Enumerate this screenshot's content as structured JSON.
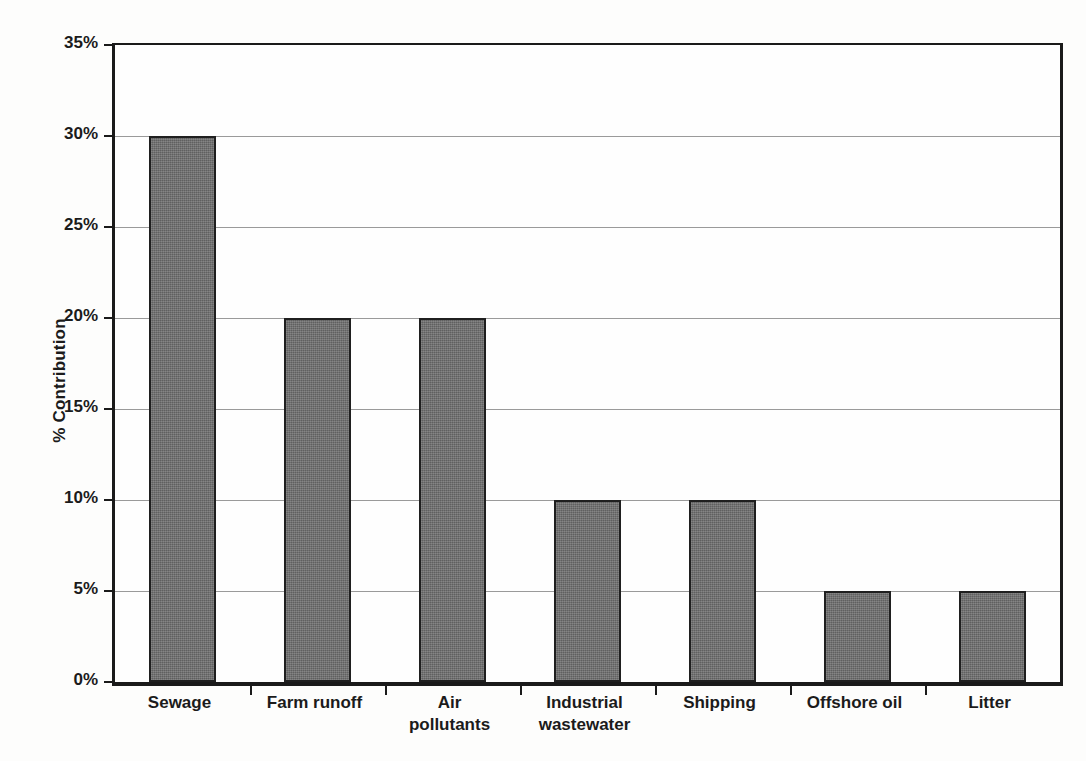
{
  "chart_data": {
    "type": "bar",
    "title": "",
    "subtitle": "",
    "xlabel": "",
    "ylabel": "% Contribution",
    "categories": [
      "Sewage",
      "Farm runoff",
      "Air pollutants",
      "Industrial wastewater",
      "Shipping",
      "Offshore oil",
      "Litter"
    ],
    "category_lines": [
      [
        "Sewage"
      ],
      [
        "Farm runoff"
      ],
      [
        "Air",
        "pollutants"
      ],
      [
        "Industrial",
        "wastewater"
      ],
      [
        "Shipping"
      ],
      [
        "Offshore oil"
      ],
      [
        "Litter"
      ]
    ],
    "values": [
      30,
      20,
      20,
      10,
      10,
      5,
      5
    ],
    "value_labels": [
      "30%",
      "20%",
      "20%",
      "10%",
      "10%",
      "5%",
      "5%"
    ],
    "ylim": [
      0,
      35
    ],
    "ytick_values": [
      0,
      5,
      10,
      15,
      20,
      25,
      30,
      35
    ],
    "ytick_labels": [
      "0%",
      "5%",
      "10%",
      "15%",
      "20%",
      "25%",
      "30%",
      "35%"
    ],
    "grid": true,
    "grid_axis": "y",
    "legend": false,
    "legend_position": "none",
    "bar_color": "#6a6a6a",
    "bar_border_color": "#1f1f1f",
    "axis_color": "#1a1a1a",
    "gridline_color": "#9a9a9a",
    "background_color": "#fdfdfc",
    "text_color": "#1b1b1b"
  }
}
